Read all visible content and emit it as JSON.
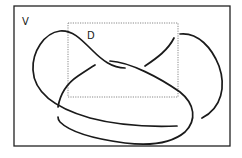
{
  "diagram": {
    "type": "knot-diagram",
    "region_outer_label": "V",
    "region_inner_label": "D",
    "colors": {
      "stroke": "#1a1a1a",
      "frame": "#222222",
      "dotted_box": "#888888",
      "background": "#ffffff"
    }
  }
}
